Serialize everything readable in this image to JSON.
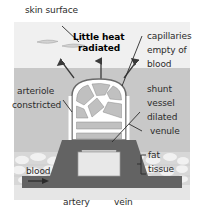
{
  "figure": {
    "labels": {
      "skin_surface": "skin surface",
      "little_heat": "Little heat",
      "radiated": "radiated",
      "capillaries": "capillaries",
      "empty_of": "empty of",
      "blood_word": "blood",
      "shunt": "shunt",
      "vessel": "vessel",
      "dilated": "dilated",
      "venule": "venule",
      "fat": "fat",
      "tissue": "tissue",
      "arteriole": "arteriole",
      "constricted": "constricted",
      "blood_flow": "blood",
      "artery": "artery",
      "vein": "vein"
    },
    "colors": {
      "page_background": "#ffffff",
      "epidermis_band": "#f0f0f0",
      "dermis_band": "#c8c8c8",
      "fat_band": "#d8d8d8",
      "fat_speckle": "#f2f2f2",
      "bottom_margin": "#e4e4e4",
      "vessel_dark": "#636363",
      "capillary_outline": "#ffffff",
      "capillary_stroke": "#5a5a5a",
      "leader_line": "#2b2b2b",
      "text": "#2b2b2b"
    },
    "bands": {
      "epidermis_top": 22,
      "dermis_top": 68,
      "fat_top": 152,
      "fat_bottom": 185
    }
  }
}
